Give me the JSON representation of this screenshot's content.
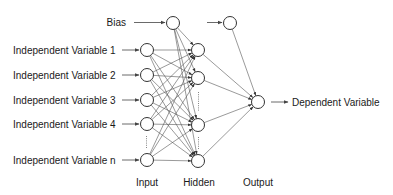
{
  "diagram": {
    "input_bias_label": "Bias",
    "input_labels": [
      "Independent Variable 1",
      "Independent Variable 2",
      "Independent Variable 3",
      "Independent Variable 4",
      "Independent Variable n"
    ],
    "output_label": "Dependent Variable",
    "layer_labels": {
      "input": "Input",
      "hidden": "Hidden",
      "output": "Output"
    },
    "layers": {
      "input_nodes": 5,
      "hidden_nodes": 4,
      "output_nodes": 1,
      "has_input_bias": true,
      "has_hidden_bias": true,
      "input_ellipsis_after": 4,
      "hidden_ellipsis_after": [
        2,
        3
      ]
    },
    "colors": {
      "node_stroke": "#333333",
      "edge": "#555555",
      "text": "#1a1a1a",
      "background": "#ffffff"
    }
  }
}
